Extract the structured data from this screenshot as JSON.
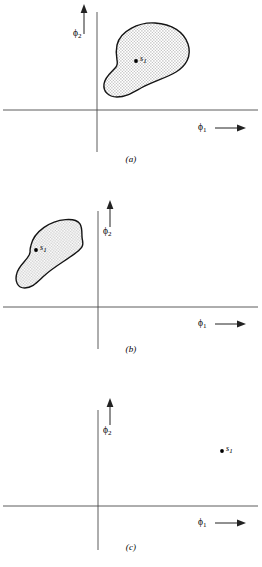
{
  "figure": {
    "background_color": "#ffffff",
    "line_color": "#3a3a3a",
    "blob_outline_color": "#111111",
    "blob_fill_color": "#d9d9d9",
    "panels": [
      {
        "id": "a",
        "caption": "(a)",
        "x_axis_label": "ϕ",
        "x_axis_sub": "1",
        "y_axis_label": "ϕ",
        "y_axis_sub": "2",
        "arrow_direction_x": "right",
        "arrow_direction_y": "up",
        "region_label": "s",
        "region_label_sub": "1",
        "region_quadrant": "first",
        "region_description": "stippled kidney-shaped region in upper-right quadrant touching the vertical axis"
      },
      {
        "id": "b",
        "caption": "(b)",
        "x_axis_label": "ϕ",
        "x_axis_sub": "1",
        "y_axis_label": "ϕ",
        "y_axis_sub": "2",
        "arrow_direction_x": "right",
        "arrow_direction_y": "up",
        "region_label": "s",
        "region_label_sub": "1",
        "region_quadrant": "second",
        "region_description": "same stippled kidney-shaped region translated into upper-left quadrant"
      },
      {
        "id": "c",
        "caption": "(c)",
        "x_axis_label": "ϕ",
        "x_axis_sub": "1",
        "y_axis_label": "ϕ",
        "y_axis_sub": "2",
        "arrow_direction_x": "right",
        "arrow_direction_y": "up",
        "region_label": "s",
        "region_label_sub": "1",
        "region_quadrant": "first-far-right",
        "region_description": "same stippled region rotated, placed far right in upper-right quadrant"
      }
    ]
  }
}
